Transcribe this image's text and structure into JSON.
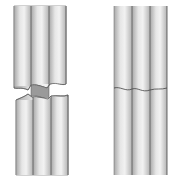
{
  "figure": {
    "left_rod": {
      "state": "fractured",
      "flutes": 3
    },
    "right_rod": {
      "state": "joined",
      "flutes": 3
    },
    "colors": {
      "background": "#ffffff",
      "edge": "#555555",
      "light": "#efefef",
      "mid": "#cfcfcf",
      "dark": "#9a9a9a"
    }
  }
}
